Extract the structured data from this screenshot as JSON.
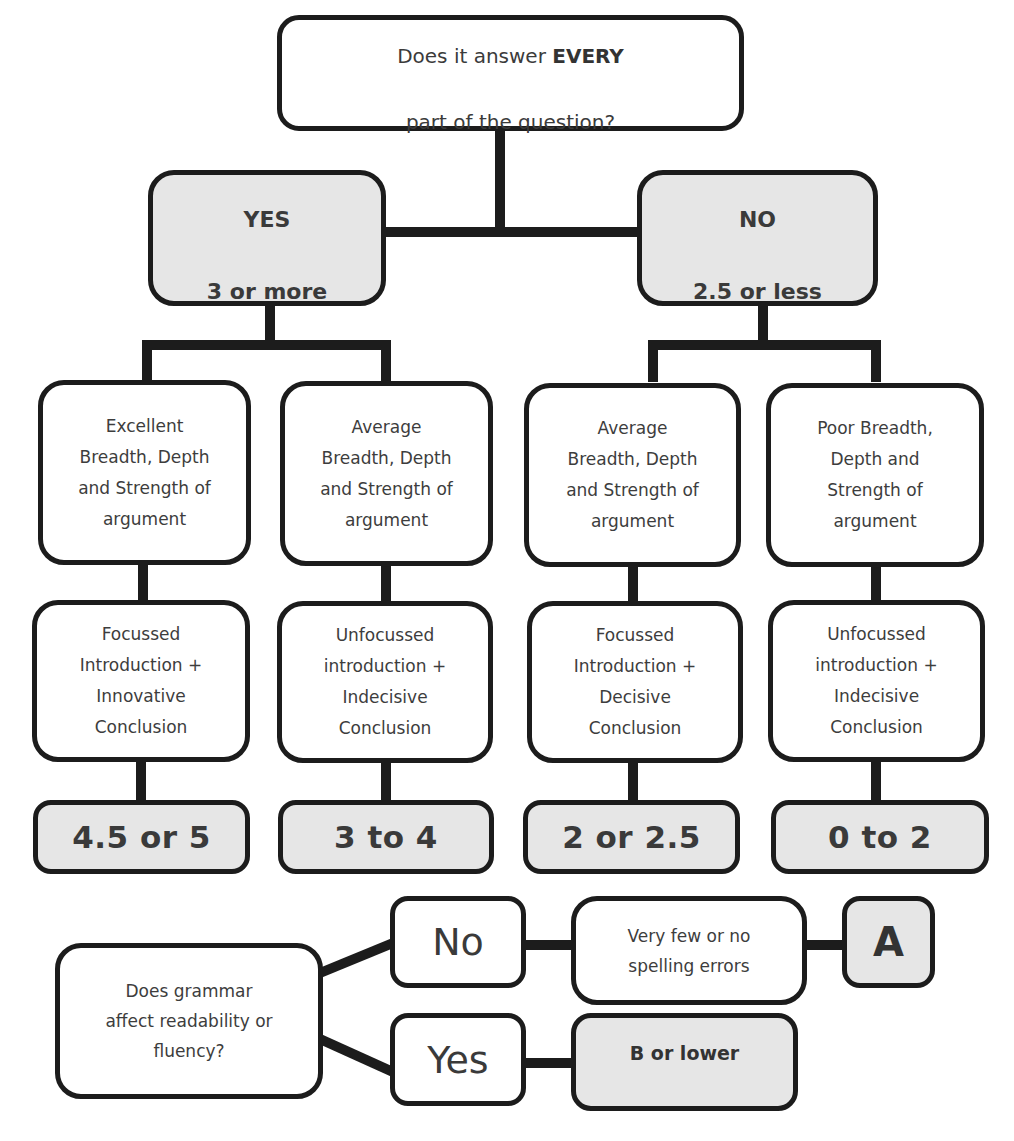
{
  "diagram": {
    "root": {
      "question_prefix": "Does it answer ",
      "question_emphasis": "EVERY",
      "question_suffix": "part of the question?"
    },
    "branches": {
      "yes": {
        "label": "YES",
        "score": "3 or more"
      },
      "no": {
        "label": "NO",
        "score": "2.5 or less"
      }
    },
    "columns": [
      {
        "argument": "Excellent\nBreadth, Depth\nand Strength of\nargument",
        "structure": "Focussed\nIntroduction +\nInnovative\nConclusion",
        "score": "4.5 or 5"
      },
      {
        "argument": "Average\nBreadth, Depth\nand Strength of\nargument",
        "structure": "Unfocussed\nintroduction +\nIndecisive\nConclusion",
        "score": "3 to 4"
      },
      {
        "argument": "Average\nBreadth, Depth\nand  Strength of\nargument",
        "structure": "Focussed\nIntroduction +\nDecisive\nConclusion",
        "score": "2 or 2.5"
      },
      {
        "argument": "Poor Breadth,\nDepth and\nStrength of\nargument",
        "structure": "Unfocussed\nintroduction +\nIndecisive\nConclusion",
        "score": "0 to 2"
      }
    ],
    "grammar": {
      "question": "Does grammar\naffect readability or\nfluency?",
      "no_label": "No",
      "yes_label": "Yes",
      "spelling": "Very few or no\nspelling errors",
      "grade_a": "A",
      "grade_b": "B or lower"
    }
  },
  "colors": {
    "border": "#1c1c1c",
    "shaded_fill": "#e6e6e6",
    "text": "#3a3a3a",
    "background": "#ffffff"
  }
}
